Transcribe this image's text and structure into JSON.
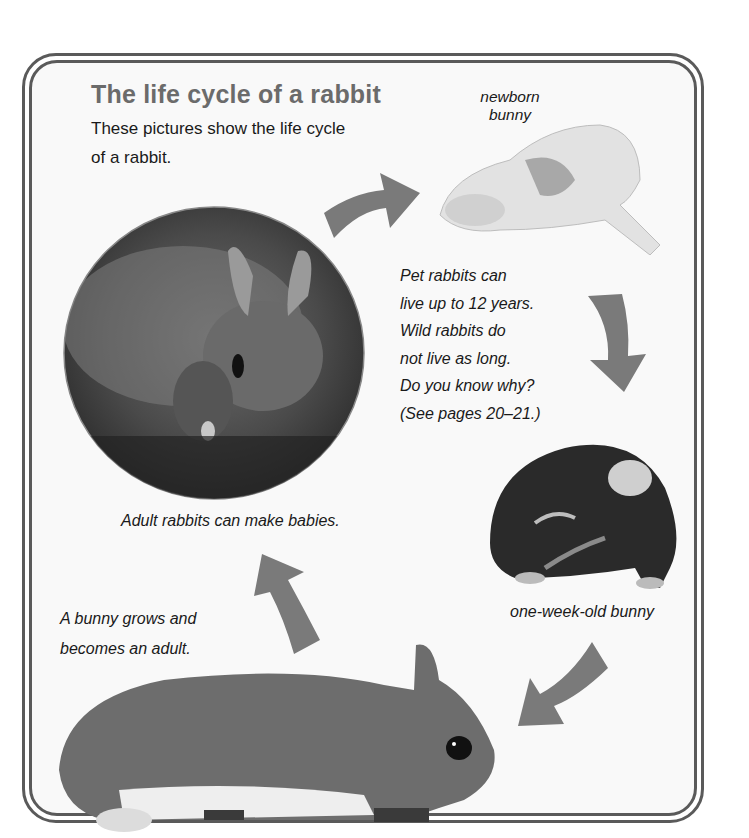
{
  "page": {
    "title": "The life cycle of a rabbit",
    "intro": "These pictures show the life cycle of a rabbit."
  },
  "captions": {
    "newborn": "newborn bunny",
    "facts": [
      "Pet rabbits can",
      "live up to 12 years.",
      "Wild rabbits do",
      "not live as long.",
      "Do you know why?",
      "(See pages 20–21.)"
    ],
    "adult_babies": "Adult rabbits can make babies.",
    "grows": [
      "A bunny grows and",
      "becomes an adult."
    ],
    "one_week": "one-week-old bunny"
  },
  "images": {
    "adults_photo": "adult-rabbits-circle-photo",
    "newborn_photo": "newborn-bunny-photo",
    "week_old_photo": "one-week-old-bunny-photo",
    "grown_photo": "adult-rabbit-photo"
  },
  "arrows": [
    "arrow-up-right",
    "arrow-down",
    "arrow-down-left",
    "arrow-up-left"
  ],
  "colors": {
    "title": "#6b6b6b",
    "arrow": "#7a7a7a",
    "frame": "#5a5a5a",
    "panel": "#f9f9f9"
  }
}
